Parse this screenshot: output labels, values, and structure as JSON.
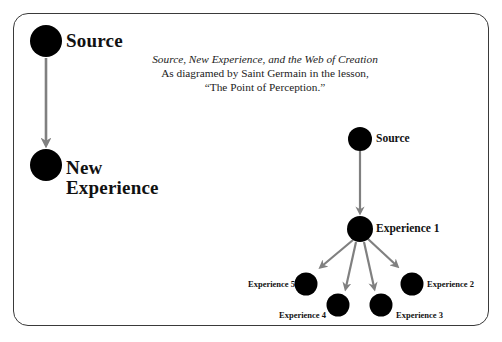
{
  "caption": {
    "title": "Source, New Experience, and the Web of Creation",
    "line2": "As diagramed by Saint Germain in the lesson,",
    "line3": "“The Point of Perception.”"
  },
  "left_diagram": {
    "nodes": [
      {
        "id": "source",
        "label": "Source"
      },
      {
        "id": "new-experience",
        "label_line1": "New",
        "label_line2": "Experience"
      }
    ],
    "edges": [
      {
        "from": "source",
        "to": "new-experience"
      }
    ]
  },
  "right_diagram": {
    "nodes": [
      {
        "id": "source",
        "label": "Source"
      },
      {
        "id": "experience-1",
        "label": "Experience 1"
      },
      {
        "id": "experience-2",
        "label": "Experience 2"
      },
      {
        "id": "experience-3",
        "label": "Experience 3"
      },
      {
        "id": "experience-4",
        "label": "Experience 4"
      },
      {
        "id": "experience-5",
        "label": "Experience 5"
      }
    ],
    "edges": [
      {
        "from": "source",
        "to": "experience-1"
      },
      {
        "from": "experience-1",
        "to": "experience-2"
      },
      {
        "from": "experience-1",
        "to": "experience-3"
      },
      {
        "from": "experience-1",
        "to": "experience-4"
      },
      {
        "from": "experience-1",
        "to": "experience-5"
      }
    ]
  },
  "colors": {
    "node": "#000000",
    "arrow": "#808080",
    "frame": "#3a3a3a",
    "text": "#111111"
  }
}
